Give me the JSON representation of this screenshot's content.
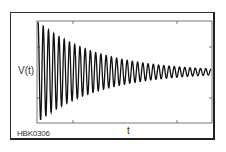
{
  "chart_data": {
    "type": "line",
    "title": "",
    "xlabel": "t",
    "ylabel": "V(t)",
    "caption_code": "HBK0306",
    "series": [
      {
        "name": "V(t)",
        "model": "A0*exp(-t/tau)*cos(2*pi*f*t)",
        "A0": 1.0,
        "cycles_shown": 33,
        "final_amplitude_ratio": 0.06
      }
    ],
    "x_ticks_count": 2,
    "y_ticks_count": 2,
    "tick_labels": [],
    "grid": false,
    "legend": null
  },
  "labels": {
    "y": "V(t)",
    "x": "t",
    "code": "HBK0306"
  },
  "colors": {
    "line": "#111111",
    "axes": "#666666",
    "frame": "#333333"
  }
}
